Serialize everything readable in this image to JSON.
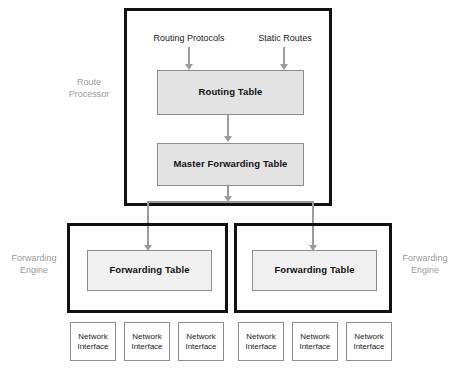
{
  "diagram": {
    "colors": {
      "heavy_border": "#111111",
      "table_fill": "#e3e3e3",
      "table_border": "#8c8c8c",
      "connector": "#9b9b9b",
      "side_label": "#9a9a9a",
      "background": "#ffffff"
    }
  },
  "route_processor": {
    "side_label_line1": "Route",
    "side_label_line2": "Processor",
    "inputs": [
      {
        "label": "Routing Protocols"
      },
      {
        "label": "Static Routes"
      }
    ],
    "routing_table": {
      "label": "Routing Table"
    },
    "master_forwarding_table": {
      "label": "Master Forwarding Table"
    }
  },
  "forwarding_engines": [
    {
      "side_label_line1": "Forwarding",
      "side_label_line2": "Engine",
      "side": "left",
      "forwarding_table": {
        "label": "Forwarding Table"
      },
      "interfaces": [
        {
          "line1": "Network",
          "line2": "Interface"
        },
        {
          "line1": "Network",
          "line2": "Interface"
        },
        {
          "line1": "Network",
          "line2": "Interface"
        }
      ]
    },
    {
      "side_label_line1": "Forwarding",
      "side_label_line2": "Engine",
      "side": "right",
      "forwarding_table": {
        "label": "Forwarding Table"
      },
      "interfaces": [
        {
          "line1": "Network",
          "line2": "Interface"
        },
        {
          "line1": "Network",
          "line2": "Interface"
        },
        {
          "line1": "Network",
          "line2": "Interface"
        }
      ]
    }
  ]
}
